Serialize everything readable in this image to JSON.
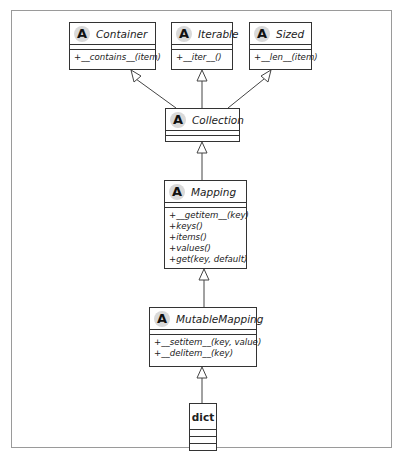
{
  "diagram": {
    "type": "uml-class-diagram",
    "classes": [
      {
        "name": "Container",
        "abstract": true,
        "badge": "A",
        "methods": [
          "+__contains__(item)"
        ]
      },
      {
        "name": "Iterable",
        "abstract": true,
        "badge": "A",
        "methods": [
          "+__iter__()"
        ]
      },
      {
        "name": "Sized",
        "abstract": true,
        "badge": "A",
        "methods": [
          "+__len__(item)"
        ]
      },
      {
        "name": "Collection",
        "abstract": true,
        "badge": "A",
        "methods": []
      },
      {
        "name": "Mapping",
        "abstract": true,
        "badge": "A",
        "methods": [
          "+__getitem__(key)",
          "+keys()",
          "+items()",
          "+values()",
          "+get(key, default)"
        ]
      },
      {
        "name": "MutableMapping",
        "abstract": true,
        "badge": "A",
        "methods": [
          "+__setitem__(key, value)",
          "+__delitem__(key)"
        ]
      },
      {
        "name": "dict",
        "abstract": false,
        "badge": "",
        "methods": []
      }
    ],
    "relations": [
      {
        "from": "Collection",
        "to": "Container",
        "type": "generalization"
      },
      {
        "from": "Collection",
        "to": "Iterable",
        "type": "generalization"
      },
      {
        "from": "Collection",
        "to": "Sized",
        "type": "generalization"
      },
      {
        "from": "Mapping",
        "to": "Collection",
        "type": "generalization"
      },
      {
        "from": "MutableMapping",
        "to": "Mapping",
        "type": "generalization"
      },
      {
        "from": "dict",
        "to": "MutableMapping",
        "type": "generalization"
      }
    ]
  },
  "colors": {
    "line": "#333333",
    "badge_bg": "#d9d9d9",
    "frame": "#9a9a9a"
  }
}
